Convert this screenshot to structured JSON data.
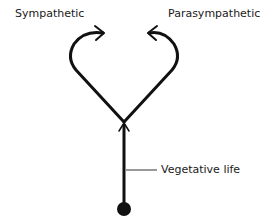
{
  "diagram": {
    "labels": {
      "sympathetic": "Sympathetic",
      "parasympathetic": "Parasympathetic",
      "vegetative_life": "Vegetative life"
    },
    "colors": {
      "stroke": "#111111",
      "background": "#ffffff"
    }
  }
}
